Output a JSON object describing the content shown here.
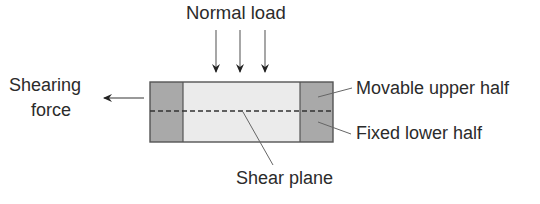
{
  "diagram": {
    "labels": {
      "normal_load": "Normal load",
      "shearing_force_line1": "Shearing",
      "shearing_force_line2": "force",
      "movable_upper_half": "Movable upper half",
      "fixed_lower_half": "Fixed lower half",
      "shear_plane": "Shear plane"
    },
    "colors": {
      "block_grey": "#a9a9a9",
      "center_fill": "#ebebeb",
      "outline": "#555555",
      "text": "#2b2b2b",
      "arrow": "#333333"
    },
    "elements": {
      "normal_load_arrows": 3,
      "shearing_force_arrow_direction": "left"
    }
  }
}
